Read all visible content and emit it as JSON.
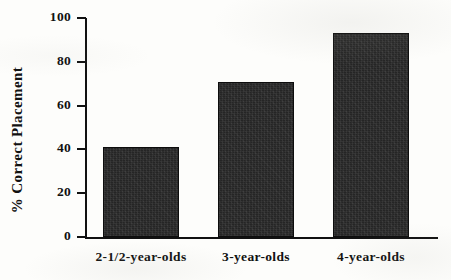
{
  "chart_data": {
    "type": "bar",
    "title": "",
    "xlabel": "",
    "ylabel": "% Correct Placement",
    "categories": [
      "2-1/2-year-olds",
      "3-year-olds",
      "4-year-olds"
    ],
    "values": [
      41,
      71,
      93
    ],
    "ylim": [
      0,
      100
    ],
    "yticks": [
      0,
      20,
      40,
      60,
      80,
      100
    ],
    "ytick_labels": [
      "0",
      "20",
      "40",
      "60",
      "80",
      "100"
    ],
    "grid": false,
    "legend": null,
    "bar_color": "#252525",
    "axis_color": "#111111",
    "background_color": "#fdfdfb"
  }
}
